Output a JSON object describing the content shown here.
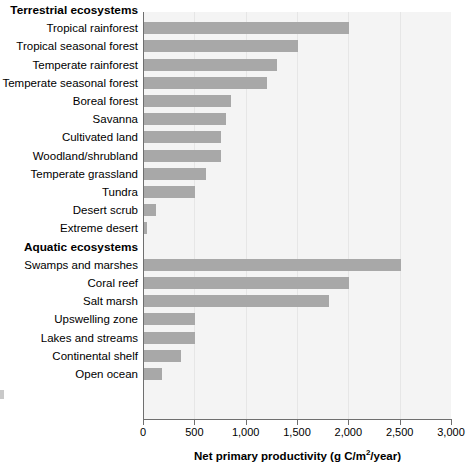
{
  "chart_data": {
    "type": "bar",
    "orientation": "horizontal",
    "title": "",
    "xlabel": "Net primary productivity (g C/m2/year)",
    "xlabel_parts": {
      "before": "Net primary productivity (g C/m",
      "sup": "2",
      "after": "/year)"
    },
    "ylabel": "",
    "xlim": [
      0,
      3000
    ],
    "xticks": [
      0,
      500,
      1000,
      1500,
      2000,
      2500,
      3000
    ],
    "xticklabels": [
      "0",
      "500",
      "1,000",
      "1,500",
      "2,000",
      "2,500",
      "3,000"
    ],
    "grid": "vertical",
    "legend": "none",
    "bar_color": "#a8a8a8",
    "plot_background": "#f4f4f4",
    "groups": [
      {
        "name": "Terrestrial ecosystems",
        "categories": [
          "Tropical rainforest",
          "Tropical seasonal forest",
          "Temperate rainforest",
          "Temperate seasonal forest",
          "Boreal forest",
          "Savanna",
          "Cultivated land",
          "Woodland/shrubland",
          "Temperate grassland",
          "Tundra",
          "Desert scrub",
          "Extreme desert"
        ],
        "values": [
          2000,
          1500,
          1300,
          1200,
          850,
          800,
          750,
          750,
          600,
          500,
          120,
          30
        ]
      },
      {
        "name": "Aquatic ecosystems",
        "categories": [
          "Swamps and marshes",
          "Coral reef",
          "Salt marsh",
          "Upswelling zone",
          "Lakes and streams",
          "Continental shelf",
          "Open ocean"
        ],
        "values": [
          2500,
          2000,
          1800,
          500,
          500,
          360,
          175
        ]
      }
    ]
  }
}
